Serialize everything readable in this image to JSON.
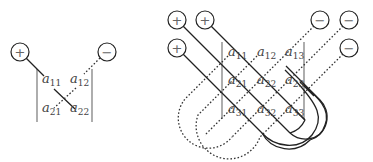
{
  "diagrams": {
    "det2": {
      "name": "2x2 determinant rule",
      "entries": [
        {
          "label": "a",
          "sub": "11",
          "x": 42,
          "y": 83
        },
        {
          "label": "a",
          "sub": "12",
          "x": 70,
          "y": 83
        },
        {
          "label": "a",
          "sub": "21",
          "x": 42,
          "y": 112
        },
        {
          "label": "a",
          "sub": "22",
          "x": 70,
          "y": 112
        }
      ],
      "signs": [
        {
          "symbol": "+",
          "cx": 20,
          "cy": 52
        },
        {
          "symbol": "−",
          "cx": 107,
          "cy": 52
        }
      ]
    },
    "det3": {
      "name": "3x3 determinant rule (Sarrus)",
      "entries": [
        {
          "label": "a",
          "sub": "11",
          "x": 228,
          "y": 56
        },
        {
          "label": "a",
          "sub": "12",
          "x": 257,
          "y": 56
        },
        {
          "label": "a",
          "sub": "13",
          "x": 285,
          "y": 56
        },
        {
          "label": "a",
          "sub": "21",
          "x": 228,
          "y": 84
        },
        {
          "label": "a",
          "sub": "22",
          "x": 257,
          "y": 84
        },
        {
          "label": "a",
          "sub": "23",
          "x": 285,
          "y": 84
        },
        {
          "label": "a",
          "sub": "31",
          "x": 228,
          "y": 113
        },
        {
          "label": "a",
          "sub": "32",
          "x": 257,
          "y": 113
        },
        {
          "label": "a",
          "sub": "33",
          "x": 285,
          "y": 113
        }
      ],
      "signs": [
        {
          "symbol": "+",
          "cx": 177,
          "cy": 20
        },
        {
          "symbol": "+",
          "cx": 205,
          "cy": 20
        },
        {
          "symbol": "+",
          "cx": 177,
          "cy": 48
        },
        {
          "symbol": "−",
          "cx": 320,
          "cy": 20
        },
        {
          "symbol": "−",
          "cx": 349,
          "cy": 20
        },
        {
          "symbol": "−",
          "cx": 349,
          "cy": 48
        }
      ]
    }
  }
}
